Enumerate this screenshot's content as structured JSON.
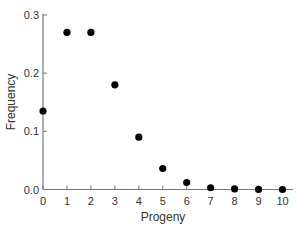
{
  "chart_data": {
    "type": "scatter",
    "title": "",
    "xlabel": "Progeny",
    "ylabel": "Frequency",
    "x": [
      0,
      1,
      2,
      3,
      4,
      5,
      6,
      7,
      8,
      9,
      10
    ],
    "series": [
      {
        "name": "Frequency",
        "values": [
          0.135,
          0.27,
          0.27,
          0.18,
          0.09,
          0.036,
          0.012,
          0.003,
          0.001,
          0.0002,
          4e-05
        ]
      }
    ],
    "xlim": [
      0,
      10
    ],
    "ylim": [
      0,
      0.3
    ],
    "xticks": [
      "0",
      "1",
      "2",
      "3",
      "4",
      "5",
      "6",
      "7",
      "8",
      "9",
      "10"
    ],
    "yticks": [
      "0.0",
      "0.1",
      "0.2",
      "0.3"
    ],
    "grid": false,
    "legend": null,
    "colors": {
      "marker": "#000000",
      "axis": "#777777",
      "text": "#333333"
    }
  }
}
